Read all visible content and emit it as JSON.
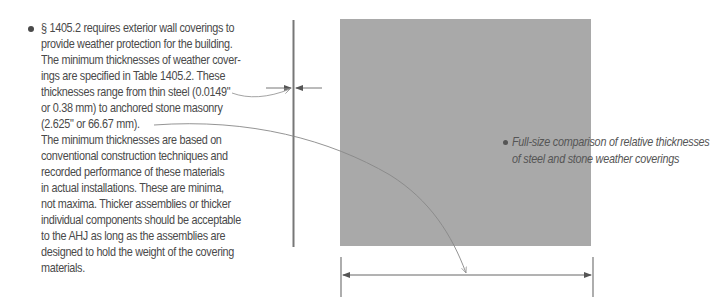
{
  "main_text": {
    "bullet": "•",
    "lines": [
      "§ 1405.2 requires exterior wall coverings to",
      "provide weather protection for the building.",
      "The minimum thicknesses of weather cover-",
      "ings are specified in Table 1405.2. These",
      "thicknesses range from thin steel (0.0149\"",
      "or 0.38 mm) to anchored stone masonry",
      "(2.625\" or 66.67 mm).",
      "The minimum thicknesses are based on",
      "conventional construction techniques and",
      "recorded performance of these materials",
      "in actual installations. These are minima,",
      "not maxima. Thicker assemblies or thicker",
      "individual components should be acceptable",
      "to the AHJ as long as the assemblies are",
      "designed to hold the weight of the covering",
      "materials."
    ]
  },
  "caption": {
    "bullet": "•",
    "lines": [
      "Full-size comparison of relative thicknesses",
      "of steel and stone weather coverings"
    ]
  },
  "colors": {
    "stone_fill": "#a9a9a9",
    "line": "#777777",
    "text": "#4a4a4a"
  }
}
